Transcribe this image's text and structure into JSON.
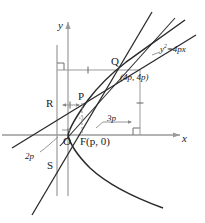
{
  "figure": {
    "type": "geometry-diagram",
    "axes": {
      "x_label": "x",
      "y_label": "y"
    },
    "curve": {
      "equation_label": "y2=4px",
      "equation_lhs": "y",
      "equation_exp": "2",
      "equation_rhs": "=4px"
    },
    "points": {
      "origin": "O",
      "focus": "F(p, 0)",
      "p_point": "P",
      "q_point": "Q",
      "q_coords": "(4p, 4p)",
      "r_point": "R",
      "s_point": "S"
    },
    "measures": {
      "two_p": "2p",
      "three_p": "3p"
    },
    "colors": {
      "axis": "#9a9a9a",
      "curve": "#2b2b2b",
      "line": "#2b2b2b",
      "guide": "#9a9a9a",
      "text": "#1a1a1a"
    }
  }
}
